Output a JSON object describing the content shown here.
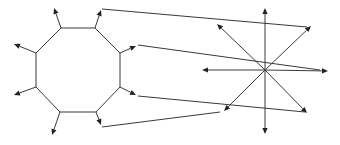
{
  "diagram": {
    "title": "",
    "colors": {
      "stroke": "#3a3a3a",
      "arrowhead": "#222222",
      "background": "#ffffff"
    },
    "octagon": {
      "vertices": [
        [
          61,
          28
        ],
        [
          95,
          28
        ],
        [
          120,
          53
        ],
        [
          120,
          87
        ],
        [
          96,
          112
        ],
        [
          60,
          112
        ],
        [
          36,
          87
        ],
        [
          36,
          53
        ]
      ],
      "arrows": [
        {
          "id": "oct-arrow-top-left",
          "from": [
            61,
            28
          ],
          "to": [
            54,
            8
          ]
        },
        {
          "id": "oct-arrow-top-right",
          "from": [
            95,
            28
          ],
          "to": [
            101,
            10
          ]
        },
        {
          "id": "oct-arrow-right-upper",
          "from": [
            120,
            53
          ],
          "to": [
            136,
            46
          ]
        },
        {
          "id": "oct-arrow-right-lower",
          "from": [
            120,
            87
          ],
          "to": [
            136,
            95
          ]
        },
        {
          "id": "oct-arrow-bottom-right",
          "from": [
            96,
            112
          ],
          "to": [
            101,
            125
          ]
        },
        {
          "id": "oct-arrow-bottom-left",
          "from": [
            60,
            112
          ],
          "to": [
            52,
            135
          ]
        },
        {
          "id": "oct-arrow-left-lower",
          "from": [
            36,
            87
          ],
          "to": [
            14,
            95
          ]
        },
        {
          "id": "oct-arrow-left-upper",
          "from": [
            36,
            53
          ],
          "to": [
            14,
            44
          ]
        }
      ]
    },
    "star": {
      "center": [
        265,
        70
      ],
      "arrows": [
        {
          "id": "star-arrow-up",
          "to": [
            265,
            8
          ]
        },
        {
          "id": "star-arrow-down",
          "to": [
            265,
            134
          ]
        },
        {
          "id": "star-arrow-left",
          "to": [
            202,
            70
          ]
        },
        {
          "id": "star-arrow-right",
          "to": [
            328,
            71
          ]
        },
        {
          "id": "star-arrow-up-left",
          "to": [
            217,
            24
          ]
        },
        {
          "id": "star-arrow-up-right",
          "to": [
            311,
            26
          ]
        },
        {
          "id": "star-arrow-down-left",
          "to": [
            224,
            111
          ]
        },
        {
          "id": "star-arrow-down-right",
          "to": [
            307,
            113
          ]
        }
      ]
    },
    "connectors": [
      {
        "id": "connector-top",
        "from": [
          102,
          9
        ],
        "to": [
          307,
          27
        ]
      },
      {
        "id": "connector-upper",
        "from": [
          138,
          45
        ],
        "to": [
          320,
          70
        ]
      },
      {
        "id": "connector-lower",
        "from": [
          138,
          96
        ],
        "to": [
          305,
          112
        ]
      },
      {
        "id": "connector-bottom",
        "from": [
          102,
          127
        ],
        "to": [
          220,
          112
        ]
      }
    ]
  }
}
